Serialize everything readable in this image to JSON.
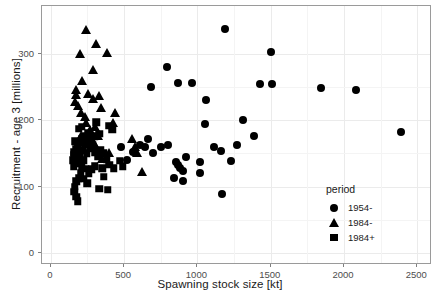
{
  "chart_data": {
    "type": "scatter",
    "title": "",
    "xlabel": "Spawning stock size [kt]",
    "ylabel": "Recruitment - age 3 [millions]",
    "xlim": [
      -60,
      2600
    ],
    "ylim": [
      -18,
      372
    ],
    "xticks": [
      0,
      500,
      1000,
      1500,
      2000,
      2500
    ],
    "yticks": [
      0,
      100,
      200,
      300
    ],
    "xtick_labels": [
      "0",
      "500",
      "1000",
      "1500",
      "2000",
      "2500"
    ],
    "ytick_labels": [
      "0",
      "100",
      "200",
      "300"
    ],
    "grid": true,
    "legend": {
      "title": "period",
      "position": "inside-bottom-right",
      "entries": [
        {
          "label": "1954-",
          "marker": "circle"
        },
        {
          "label": "1984-",
          "marker": "triangle"
        },
        {
          "label": "1984+",
          "marker": "square"
        }
      ]
    },
    "series": [
      {
        "name": "1954-",
        "marker": "circle",
        "color": "#000000",
        "points": [
          [
            685,
            250
          ],
          [
            790,
            280
          ],
          [
            865,
            256
          ],
          [
            960,
            256
          ],
          [
            1190,
            337
          ],
          [
            1060,
            231
          ],
          [
            1055,
            195
          ],
          [
            1110,
            160
          ],
          [
            1160,
            154
          ],
          [
            1230,
            138
          ],
          [
            1270,
            163
          ],
          [
            1310,
            200
          ],
          [
            1430,
            255
          ],
          [
            1500,
            303
          ],
          [
            1510,
            255
          ],
          [
            1845,
            249
          ],
          [
            2080,
            246
          ],
          [
            2390,
            183
          ],
          [
            1170,
            89
          ],
          [
            900,
            123
          ],
          [
            880,
            128
          ],
          [
            870,
            133
          ],
          [
            855,
            137
          ],
          [
            840,
            113
          ],
          [
            900,
            108
          ],
          [
            925,
            144
          ],
          [
            700,
            151
          ],
          [
            640,
            159
          ],
          [
            610,
            163
          ],
          [
            560,
            152
          ],
          [
            1385,
            176
          ],
          [
            1020,
            137
          ],
          [
            800,
            163
          ],
          [
            750,
            160
          ],
          [
            660,
            171
          ],
          [
            1020,
            121
          ],
          [
            480,
            160
          ],
          [
            520,
            140
          ]
        ]
      },
      {
        "name": "1984-",
        "marker": "triangle",
        "color": "#000000",
        "points": [
          [
            240,
            337
          ],
          [
            200,
            301
          ],
          [
            310,
            315
          ],
          [
            385,
            302
          ],
          [
            285,
            277
          ],
          [
            215,
            260
          ],
          [
            170,
            247
          ],
          [
            170,
            238
          ],
          [
            168,
            228
          ],
          [
            185,
            222
          ],
          [
            255,
            240
          ],
          [
            290,
            232
          ],
          [
            330,
            237
          ],
          [
            345,
            219
          ],
          [
            440,
            212
          ],
          [
            425,
            196
          ],
          [
            555,
            173
          ],
          [
            575,
            160
          ],
          [
            590,
            152
          ],
          [
            620,
            123
          ],
          [
            300,
            190
          ],
          [
            320,
            177
          ],
          [
            265,
            186
          ],
          [
            240,
            196
          ],
          [
            350,
            143
          ],
          [
            310,
            160
          ],
          [
            290,
            168
          ],
          [
            230,
            205
          ],
          [
            205,
            212
          ],
          [
            400,
            151
          ],
          [
            205,
            177
          ],
          [
            195,
            168
          ]
        ]
      },
      {
        "name": "1984+",
        "marker": "square",
        "color": "#000000",
        "points": [
          [
            310,
            197
          ],
          [
            400,
            192
          ],
          [
            420,
            186
          ],
          [
            330,
            180
          ],
          [
            255,
            181
          ],
          [
            235,
            176
          ],
          [
            215,
            172
          ],
          [
            200,
            166
          ],
          [
            185,
            161
          ],
          [
            172,
            157
          ],
          [
            160,
            152
          ],
          [
            155,
            147
          ],
          [
            168,
            143
          ],
          [
            180,
            139
          ],
          [
            195,
            135
          ],
          [
            210,
            131
          ],
          [
            225,
            140
          ],
          [
            245,
            150
          ],
          [
            265,
            158
          ],
          [
            285,
            163
          ],
          [
            300,
            152
          ],
          [
            320,
            146
          ],
          [
            340,
            155
          ],
          [
            360,
            150
          ],
          [
            380,
            141
          ],
          [
            400,
            133
          ],
          [
            430,
            128
          ],
          [
            470,
            139
          ],
          [
            490,
            131
          ],
          [
            205,
            121
          ],
          [
            190,
            113
          ],
          [
            175,
            108
          ],
          [
            165,
            100
          ],
          [
            160,
            92
          ],
          [
            172,
            85
          ],
          [
            185,
            78
          ],
          [
            360,
            115
          ],
          [
            330,
            97
          ],
          [
            390,
            95
          ],
          [
            240,
            127
          ],
          [
            260,
            120
          ],
          [
            280,
            126
          ],
          [
            225,
            112
          ],
          [
            250,
            105
          ],
          [
            300,
            131
          ],
          [
            350,
            128
          ],
          [
            155,
            130
          ],
          [
            150,
            140
          ],
          [
            165,
            168
          ],
          [
            175,
            150
          ],
          [
            195,
            145
          ],
          [
            215,
            155
          ],
          [
            235,
            163
          ],
          [
            255,
            168
          ],
          [
            275,
            172
          ],
          [
            295,
            176
          ],
          [
            190,
            187
          ],
          [
            210,
            190
          ]
        ]
      }
    ]
  }
}
